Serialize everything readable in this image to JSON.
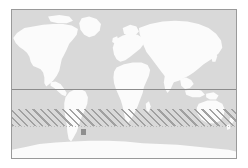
{
  "figure": {
    "type": "world-map",
    "projection": "equirectangular",
    "title": "",
    "caption": "",
    "background_color": "#ffffff"
  },
  "map": {
    "frame": {
      "border_color": "#9a9a9a",
      "border_width_px": 1,
      "left_px": 11,
      "top_px": 9,
      "width_px": 226,
      "height_px": 150
    },
    "ocean_color": "#d9d9d9",
    "land_color": "#fbfbfb",
    "lon_range": [
      -180,
      180
    ],
    "lat_range": [
      -90,
      90
    ]
  },
  "overlays": {
    "equator_line": {
      "label": "equator",
      "color": "#8c8c8c",
      "style": "solid",
      "latitude": 0
    },
    "band_lower_guide": {
      "label": "band lower boundary",
      "color": "#b9b9b9",
      "style": "dotted"
    },
    "hatched_band": {
      "label": "hatched latitude band",
      "hatch_color": "#9e9e9e",
      "hatch_angle_deg": 45,
      "lat_top": -12,
      "lat_bottom": -33
    },
    "point_marker": {
      "label": "site marker",
      "color": "#8f8f8f",
      "shape": "square",
      "lon": -72,
      "lat": -33
    }
  },
  "landmasses": [
    {
      "name": "north-america"
    },
    {
      "name": "south-america"
    },
    {
      "name": "greenland"
    },
    {
      "name": "europe"
    },
    {
      "name": "africa"
    },
    {
      "name": "asia"
    },
    {
      "name": "australia"
    },
    {
      "name": "antarctica"
    }
  ]
}
